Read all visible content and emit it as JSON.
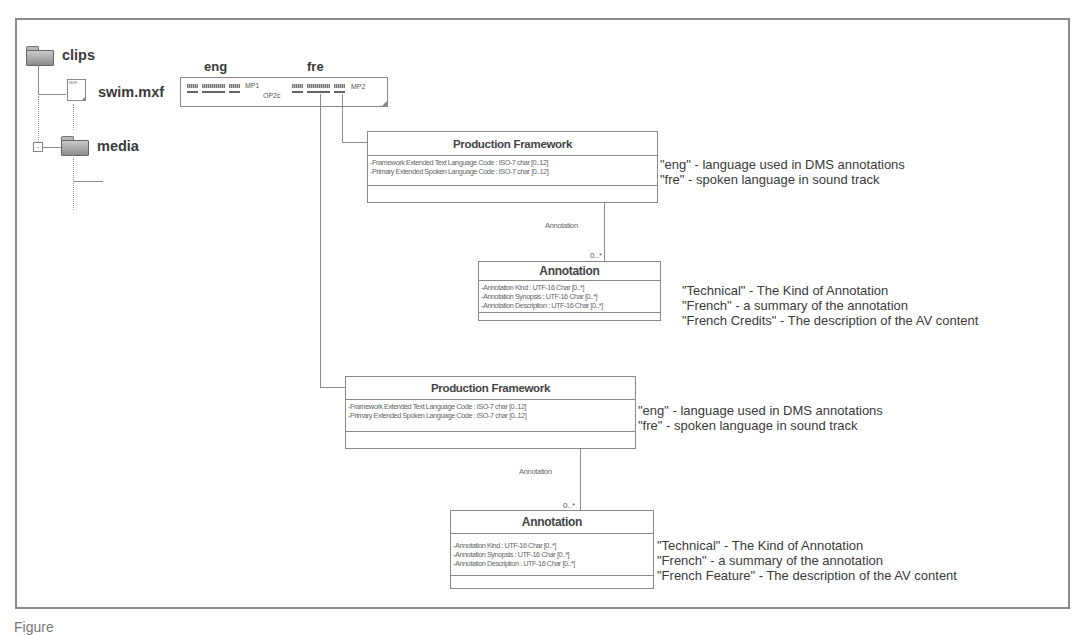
{
  "tree": {
    "root_folder": "clips",
    "file": "swim.mxf",
    "file_icon_mark": "MXF",
    "sub_folder": "media",
    "expander_symbol": "-"
  },
  "track_strip": {
    "lang_left": "eng",
    "lang_right": "fre",
    "label_mp1": "MP1",
    "label_op": "OP2c",
    "label_mp2": "MP2"
  },
  "framework_1": {
    "title": "Production Framework",
    "attributes": [
      "-Framework Extended Text Language Code : ISO-7 char [0..12]",
      "-Primary Extended Spoken Language Code : ISO-7 char [0..12]"
    ],
    "notes": [
      "\"eng\" - language used in DMS  annotations",
      "\"fre\" - spoken language in sound track"
    ]
  },
  "association_1": {
    "label": "Annotation",
    "multiplicity": "0..*"
  },
  "annotation_1": {
    "title": "Annotation",
    "attributes": [
      "-Annotation Kind : UTF-16 Char [0..*]",
      "-Annotation Synopsis : UTF-16 Char [0..*]",
      "-Annotation Description : UTF-16 Char [0..*]"
    ],
    "notes": [
      "\"Technical\" - The Kind of Annotation",
      "\"French\" - a summary of the annotation",
      "\"French Credits\" - The description of the AV content"
    ]
  },
  "framework_2": {
    "title": "Production Framework",
    "attributes": [
      "-Framework Extended Text Language Code : ISO-7 char [0..12]",
      "-Primary Extended Spoken Language Code : ISO-7 char [0..12]"
    ],
    "notes": [
      "\"eng\" - language used in DMS  annotations",
      "\"fre\" - spoken language in sound track"
    ]
  },
  "association_2": {
    "label": "Annotation",
    "multiplicity": "0..*"
  },
  "annotation_2": {
    "title": "Annotation",
    "attributes": [
      "-Annotation Kind : UTF-16 Char [0..*]",
      "-Annotation Synopsis : UTF-16 Char [0..*]",
      "-Annotation Description : UTF-16 Char [0..*]"
    ],
    "notes": [
      "\"Technical\" - The Kind of Annotation",
      "\"French\" - a summary of the annotation",
      "\"French Feature\" - The description of the AV content"
    ]
  },
  "caption": "Figure"
}
